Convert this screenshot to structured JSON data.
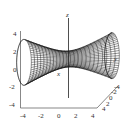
{
  "chart_data": {
    "type": "surface3d",
    "title": "",
    "surface": "hyperboloid of one sheet",
    "equation_hint": "x^2 + z^2 - y^2 = 1 (throat along y-axis)",
    "axes": {
      "x": {
        "label": "x",
        "range": [
          -4,
          4
        ],
        "ticks": [
          "-4",
          "-2",
          "0",
          "2",
          "4"
        ]
      },
      "y": {
        "label": "y",
        "range": [
          -4,
          4
        ],
        "ticks": [
          "4",
          "2",
          "0",
          "-2",
          "-4"
        ]
      },
      "z": {
        "label": "z",
        "range": [
          -4,
          4
        ],
        "ticks": [
          "4",
          "2",
          "0",
          "-2",
          "-4"
        ]
      }
    },
    "mesh": {
      "style": "wireframe",
      "color": "#111111",
      "fill": "#ffffff"
    },
    "grid": false,
    "legend": null
  },
  "labels": {
    "x": "x",
    "y": "y",
    "z": "z",
    "z_ticks": [
      "4",
      "2",
      "0",
      "-2",
      "-4"
    ],
    "x_ticks": [
      "-4",
      "-2",
      "0",
      "2",
      "4"
    ],
    "y_ticks": [
      "4",
      "2",
      "0",
      "-2",
      "-4"
    ]
  }
}
